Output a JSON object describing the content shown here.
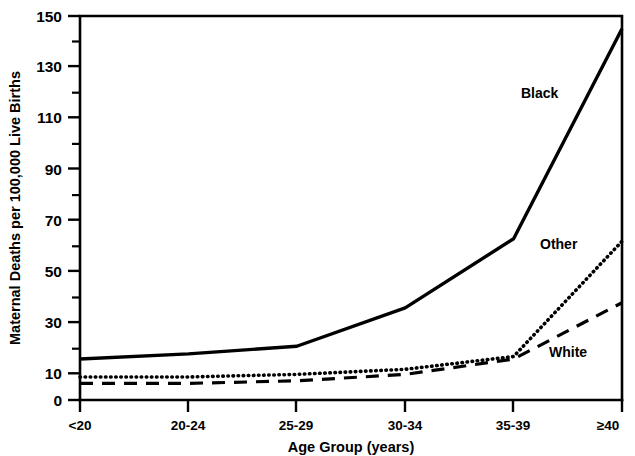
{
  "chart_data": {
    "type": "line",
    "title": "",
    "xlabel": "Age Group (years)",
    "ylabel": "Maternal Deaths per 100,000 Live Births",
    "categories": [
      "<20",
      "20-24",
      "25-29",
      "30-34",
      "35-39",
      "≥40"
    ],
    "series": [
      {
        "name": "Black",
        "style": "solid",
        "values": [
          16,
          18,
          21,
          36,
          63,
          145
        ]
      },
      {
        "name": "Other",
        "style": "dotted",
        "values": [
          9,
          9,
          10,
          12,
          17,
          62
        ]
      },
      {
        "name": "White",
        "style": "dashed",
        "values": [
          6.5,
          6.5,
          7.5,
          10,
          16,
          38
        ]
      }
    ],
    "ylim": [
      0,
      150
    ],
    "ytick_labels": [
      "0",
      "10",
      "30",
      "50",
      "70",
      "90",
      "110",
      "130",
      "150"
    ],
    "ytick_values": [
      0,
      10,
      30,
      50,
      70,
      90,
      110,
      130,
      150
    ],
    "yminor_values": [
      20,
      40,
      60,
      80,
      100,
      120,
      140
    ],
    "grid": false,
    "legend": "inline-labels",
    "annotations": [
      {
        "text": "Black",
        "x_px": 521,
        "y_px": 93
      },
      {
        "text": "Other",
        "x_px": 543,
        "y_px": 244
      },
      {
        "text": "White",
        "x_px": 551,
        "y_px": 352
      }
    ]
  },
  "axis": {
    "y_title": "Maternal Deaths per 100,000 Live Births",
    "x_title": "Age Group (years)",
    "y_labels": {
      "t0": "0",
      "t10": "10",
      "t30": "30",
      "t50": "50",
      "t70": "70",
      "t90": "90",
      "t110": "110",
      "t130": "130",
      "t150": "150"
    },
    "x_labels": {
      "c0": "<20",
      "c1": "20-24",
      "c2": "25-29",
      "c3": "30-34",
      "c4": "35-39",
      "c5": "≥40"
    }
  },
  "series_labels": {
    "black": "Black",
    "other": "Other",
    "white": "White"
  },
  "colors": {
    "ink": "#000000",
    "background": "#ffffff"
  }
}
